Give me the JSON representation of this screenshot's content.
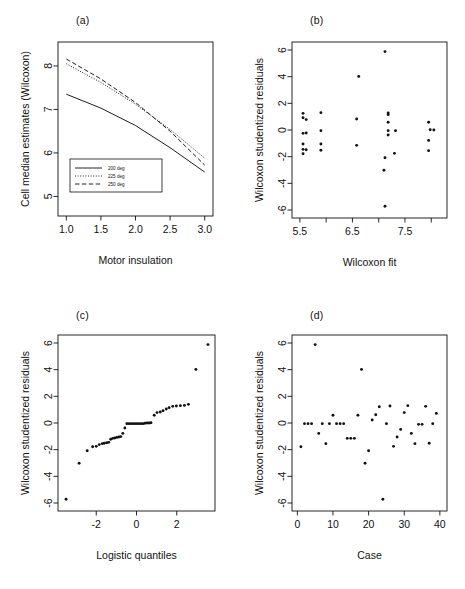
{
  "figure": {
    "panels": [
      {
        "letter": "(a)"
      },
      {
        "letter": "(b)"
      },
      {
        "letter": "(c)"
      },
      {
        "letter": "(d)"
      }
    ]
  },
  "chart_data": [
    {
      "id": "panel-a",
      "panel_letter": "(a)",
      "type": "line",
      "title": "",
      "xlabel": "Motor insulation",
      "ylabel": "Cell median estimates (Wilcoxon)",
      "xlim": [
        0.88,
        3.12
      ],
      "ylim": [
        4.55,
        8.55
      ],
      "xticks": [
        1.0,
        1.5,
        2.0,
        2.5,
        3.0
      ],
      "xticklabels": [
        "1.0",
        "1.5",
        "2.0",
        "2.5",
        "3.0"
      ],
      "yticks": [
        5,
        6,
        7,
        8
      ],
      "yticklabels": [
        "5",
        "6",
        "7",
        "8"
      ],
      "grid": false,
      "legend_position": "bottom-left",
      "series": [
        {
          "name": "200 deg",
          "style": "solid",
          "x": [
            1.0,
            1.5,
            2.0,
            2.5,
            3.0
          ],
          "values": [
            7.35,
            7.03,
            6.63,
            6.12,
            5.56
          ]
        },
        {
          "name": "225 deg",
          "style": "dotted",
          "x": [
            1.0,
            1.5,
            2.0,
            2.5,
            3.0
          ],
          "values": [
            8.05,
            7.62,
            7.12,
            6.54,
            5.88
          ]
        },
        {
          "name": "250 deg",
          "style": "dashed",
          "x": [
            1.0,
            1.5,
            2.0,
            2.5,
            3.0
          ],
          "values": [
            8.16,
            7.7,
            7.16,
            6.5,
            5.72
          ]
        }
      ]
    },
    {
      "id": "panel-b",
      "panel_letter": "(b)",
      "type": "scatter",
      "title": "",
      "xlabel": "Wilcoxon fit",
      "ylabel": "Wilcoxon studentized residuals",
      "xlim": [
        5.35,
        8.3
      ],
      "ylim": [
        -6.6,
        6.6
      ],
      "xticks": [
        5.5,
        6.5,
        7.5
      ],
      "xticklabels": [
        "5.5",
        "6.5",
        "7.5"
      ],
      "xminorticks": [
        6.0,
        7.0,
        8.0
      ],
      "yticks": [
        -6,
        -4,
        -2,
        0,
        2,
        4,
        6
      ],
      "yticklabels": [
        "-6",
        "-4",
        "-2",
        "0",
        "2",
        "4",
        "6"
      ],
      "grid": false,
      "points": [
        [
          5.56,
          1.25
        ],
        [
          5.56,
          0.92
        ],
        [
          5.62,
          0.78
        ],
        [
          5.56,
          -0.25
        ],
        [
          5.62,
          -0.22
        ],
        [
          5.56,
          -1.05
        ],
        [
          5.56,
          -1.45
        ],
        [
          5.62,
          -1.48
        ],
        [
          5.56,
          -1.78
        ],
        [
          5.9,
          1.3
        ],
        [
          5.9,
          -0.05
        ],
        [
          5.9,
          -1.05
        ],
        [
          5.9,
          -1.52
        ],
        [
          6.62,
          4.02
        ],
        [
          6.58,
          0.82
        ],
        [
          6.58,
          -1.15
        ],
        [
          7.12,
          5.88
        ],
        [
          7.18,
          1.28
        ],
        [
          7.18,
          1.15
        ],
        [
          7.18,
          0.58
        ],
        [
          7.18,
          -0.05
        ],
        [
          7.18,
          -0.38
        ],
        [
          7.32,
          -0.05
        ],
        [
          7.12,
          -2.08
        ],
        [
          7.3,
          -1.75
        ],
        [
          7.1,
          -3.02
        ],
        [
          7.12,
          -5.72
        ],
        [
          7.95,
          0.58
        ],
        [
          7.98,
          0.02
        ],
        [
          8.05,
          0.0
        ],
        [
          7.95,
          -0.78
        ],
        [
          7.95,
          -1.55
        ]
      ]
    },
    {
      "id": "panel-c",
      "panel_letter": "(c)",
      "type": "scatter",
      "title": "",
      "xlabel": "Logistic quantiles",
      "ylabel": "Wilcoxon studentized residuals",
      "xlim": [
        -3.9,
        3.9
      ],
      "ylim": [
        -6.6,
        6.6
      ],
      "xticks": [
        -2,
        0,
        2
      ],
      "xticklabels": [
        "-2",
        "0",
        "2"
      ],
      "yticks": [
        -6,
        -4,
        -2,
        0,
        2,
        4,
        6
      ],
      "yticklabels": [
        "-6",
        "-4",
        "-2",
        "0",
        "2",
        "4",
        "6"
      ],
      "grid": false,
      "points": [
        [
          -3.5,
          -5.72
        ],
        [
          -2.85,
          -3.02
        ],
        [
          -2.45,
          -2.08
        ],
        [
          -2.18,
          -1.78
        ],
        [
          -2.0,
          -1.75
        ],
        [
          -1.85,
          -1.62
        ],
        [
          -1.7,
          -1.55
        ],
        [
          -1.6,
          -1.52
        ],
        [
          -1.48,
          -1.48
        ],
        [
          -1.38,
          -1.45
        ],
        [
          -1.28,
          -1.22
        ],
        [
          -1.18,
          -1.15
        ],
        [
          -1.08,
          -1.12
        ],
        [
          -0.98,
          -1.08
        ],
        [
          -0.88,
          -1.05
        ],
        [
          -0.78,
          -1.02
        ],
        [
          -0.68,
          -0.78
        ],
        [
          -0.58,
          -0.38
        ],
        [
          -0.48,
          -0.05
        ],
        [
          -0.38,
          -0.05
        ],
        [
          -0.28,
          -0.05
        ],
        [
          -0.18,
          -0.05
        ],
        [
          -0.08,
          -0.05
        ],
        [
          0.02,
          -0.05
        ],
        [
          0.12,
          -0.05
        ],
        [
          0.22,
          -0.05
        ],
        [
          0.32,
          -0.05
        ],
        [
          0.42,
          -0.02
        ],
        [
          0.52,
          0.0
        ],
        [
          0.62,
          0.0
        ],
        [
          0.72,
          0.02
        ],
        [
          0.88,
          0.58
        ],
        [
          1.02,
          0.78
        ],
        [
          1.18,
          0.82
        ],
        [
          1.32,
          0.92
        ],
        [
          1.48,
          1.05
        ],
        [
          1.62,
          1.15
        ],
        [
          1.8,
          1.25
        ],
        [
          1.98,
          1.28
        ],
        [
          2.18,
          1.3
        ],
        [
          2.38,
          1.32
        ],
        [
          2.58,
          1.4
        ],
        [
          2.95,
          4.02
        ],
        [
          3.55,
          5.88
        ]
      ]
    },
    {
      "id": "panel-d",
      "panel_letter": "(d)",
      "type": "scatter",
      "title": "",
      "xlabel": "Case",
      "ylabel": "Wilcoxon studentized residuals",
      "xlim": [
        -1.5,
        42
      ],
      "ylim": [
        -6.6,
        6.6
      ],
      "xticks": [
        0,
        10,
        20,
        30,
        40
      ],
      "xticklabels": [
        "0",
        "10",
        "20",
        "30",
        "40"
      ],
      "yticks": [
        -6,
        -4,
        -2,
        0,
        2,
        4,
        6
      ],
      "yticklabels": [
        "-6",
        "-4",
        "-2",
        "0",
        "2",
        "4",
        "6"
      ],
      "grid": false,
      "points": [
        [
          1,
          -1.78
        ],
        [
          2,
          -0.05
        ],
        [
          3,
          -0.05
        ],
        [
          4,
          -0.05
        ],
        [
          5,
          5.88
        ],
        [
          6,
          -0.78
        ],
        [
          7,
          -0.05
        ],
        [
          8,
          -1.55
        ],
        [
          9,
          -0.05
        ],
        [
          10,
          0.58
        ],
        [
          11,
          -0.05
        ],
        [
          12,
          -0.05
        ],
        [
          13,
          -0.05
        ],
        [
          14,
          -1.15
        ],
        [
          15,
          -1.15
        ],
        [
          16,
          -1.15
        ],
        [
          17,
          0.58
        ],
        [
          18,
          4.02
        ],
        [
          19,
          -3.02
        ],
        [
          20,
          -2.08
        ],
        [
          21,
          0.22
        ],
        [
          22,
          0.62
        ],
        [
          23,
          1.22
        ],
        [
          24,
          -5.72
        ],
        [
          25,
          -0.05
        ],
        [
          26,
          1.28
        ],
        [
          27,
          -1.75
        ],
        [
          28,
          -1.05
        ],
        [
          29,
          -0.48
        ],
        [
          30,
          0.78
        ],
        [
          31,
          1.3
        ],
        [
          32,
          -0.78
        ],
        [
          33,
          -1.55
        ],
        [
          34,
          -0.1
        ],
        [
          35,
          -0.1
        ],
        [
          36,
          1.25
        ],
        [
          37,
          -1.52
        ],
        [
          38,
          -0.05
        ],
        [
          39,
          0.72
        ]
      ]
    }
  ]
}
